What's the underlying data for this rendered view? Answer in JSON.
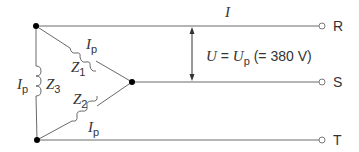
{
  "diagram": {
    "line_current_label": {
      "symbol": "I"
    },
    "phase_currents": [
      {
        "id": "Z1",
        "symbol": "I",
        "subscript": "p"
      },
      {
        "id": "Z2",
        "symbol": "I",
        "subscript": "p"
      },
      {
        "id": "Z3",
        "symbol": "I",
        "subscript": "p"
      }
    ],
    "impedances": [
      {
        "symbol": "Z",
        "subscript": "1"
      },
      {
        "symbol": "Z",
        "subscript": "2"
      },
      {
        "symbol": "Z",
        "subscript": "3"
      }
    ],
    "voltage": {
      "lhs": "U",
      "eq": " = ",
      "rhs_symbol": "U",
      "rhs_subscript": "p",
      "value_text": " (= 380 V)"
    },
    "terminals": [
      {
        "label": "R"
      },
      {
        "label": "S"
      },
      {
        "label": "T"
      }
    ],
    "colors": {
      "wire": "#6a6a6a",
      "node": "#000000",
      "text": "#333333"
    }
  }
}
